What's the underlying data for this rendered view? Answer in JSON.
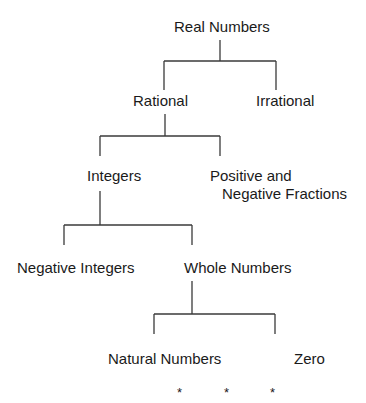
{
  "diagram": {
    "nodes": {
      "real": "Real Numbers",
      "rational": "Rational",
      "irrational": "Irrational",
      "integers": "Integers",
      "fractions_line1": "Positive and",
      "fractions_line2": "Negative Fractions",
      "negative_integers": "Negative Integers",
      "whole": "Whole Numbers",
      "natural": "Natural Numbers",
      "zero": "Zero"
    },
    "ellipsis": [
      "*",
      "*",
      "*"
    ],
    "edges": [
      [
        "Real Numbers",
        "Rational"
      ],
      [
        "Real Numbers",
        "Irrational"
      ],
      [
        "Rational",
        "Integers"
      ],
      [
        "Rational",
        "Positive and Negative Fractions"
      ],
      [
        "Integers",
        "Negative Integers"
      ],
      [
        "Integers",
        "Whole Numbers"
      ],
      [
        "Whole Numbers",
        "Natural Numbers"
      ],
      [
        "Whole Numbers",
        "Zero"
      ]
    ],
    "line_color": "#3a3a3a",
    "text_color": "#1a1a1a"
  }
}
